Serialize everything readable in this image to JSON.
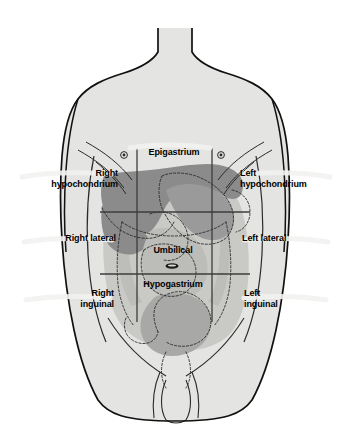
{
  "diagram": {
    "labels": {
      "epigastrium": "Epigastrium",
      "right_hypochondrium_line1": "Right",
      "right_hypochondrium_line2": "hypochondrium",
      "left_hypochondrium_line1": "Left",
      "left_hypochondrium_line2": "hypochondrium",
      "right_lateral": "Right lateral",
      "umbilical": "Umbilical",
      "left_lateral": "Left lateral",
      "right_inguinal_line1": "Right",
      "right_inguinal_line2": "inguinal",
      "hypogastrium": "Hypogastrium",
      "left_inguinal_line1": "Left",
      "left_inguinal_line2": "inguinal"
    },
    "colors": {
      "skin_fill": "#e4e4e2",
      "outline": "#1a1a1a",
      "liver_dark": "#8b8b8b",
      "organ_mid": "#a8a8a6",
      "organ_light": "#c9c9c6",
      "grid_line": "#4a4a4a",
      "label_text": "#000000",
      "background": "#ffffff"
    },
    "grid": {
      "vertical_left_x": 137,
      "vertical_right_x": 212,
      "horizontal_upper_y": 212,
      "horizontal_lower_y": 274
    },
    "markers": {
      "nipple_right": "nipple-marker",
      "nipple_left": "nipple-marker",
      "umbilicus": "umbilicus-marker"
    }
  }
}
